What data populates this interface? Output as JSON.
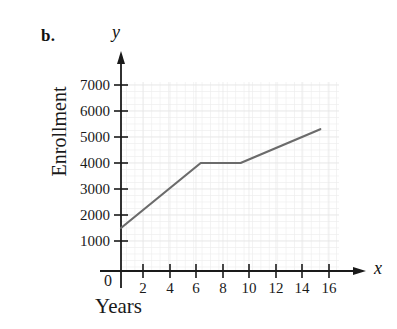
{
  "figure": {
    "part_label": "b.",
    "background_color": "#ffffff"
  },
  "axes": {
    "y_variable_label": "y",
    "x_variable_label": "x",
    "origin_label": "0",
    "y_title": "Enrollment",
    "x_title": "Years",
    "axis_color": "#1a1a1a",
    "grid_color": "#e2e2e2"
  },
  "chart_data": {
    "type": "line",
    "title": "",
    "subtitle": "",
    "xlabel": "Years",
    "ylabel": "Enrollment",
    "xlim": [
      0,
      17
    ],
    "ylim": [
      0,
      7600
    ],
    "grid": true,
    "legend": null,
    "legend_position": "none",
    "line_color": "#6b6b6b",
    "line_width": 2.2,
    "x_ticks": [
      0,
      2,
      4,
      6,
      8,
      10,
      12,
      14,
      16
    ],
    "x_tick_labels": [
      "0",
      "2",
      "4",
      "6",
      "8",
      "10",
      "12",
      "14",
      "16"
    ],
    "y_ticks": [
      1000,
      2000,
      3000,
      4000,
      5000,
      6000,
      7000
    ],
    "y_tick_labels": [
      "1000",
      "2000",
      "3000",
      "4000",
      "5000",
      "6000",
      "7000"
    ],
    "series": [
      {
        "name": "Enrollment",
        "x": [
          0,
          6,
          9,
          15
        ],
        "values": [
          1500,
          4000,
          4000,
          5300
        ]
      }
    ]
  }
}
